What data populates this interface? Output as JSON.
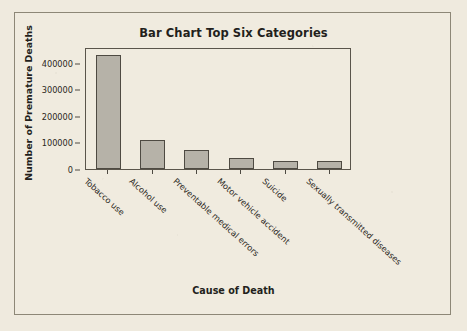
{
  "chart_data": {
    "type": "bar",
    "title": "Bar Chart Top Six Categories",
    "xlabel": "Cause of Death",
    "ylabel": "Number of Premature Deaths",
    "categories": [
      "Tobacco use",
      "Alcohol use",
      "Preventable medical errors",
      "Motor vehicle accident",
      "Suicide",
      "Sexually transmitted diseases"
    ],
    "values": [
      430000,
      110000,
      70000,
      43000,
      30000,
      30000
    ],
    "ylim": [
      0,
      460000
    ],
    "yticks": [
      0,
      100000,
      200000,
      300000,
      400000
    ],
    "ytick_labels": [
      "0",
      "100000",
      "200000",
      "300000",
      "400000"
    ],
    "grid": false,
    "legend": "none",
    "bar_color": "#b6b2a8",
    "bar_edge_color": "#4e4a42",
    "background_color": "#efeade",
    "axis_color": "#5a554b"
  }
}
